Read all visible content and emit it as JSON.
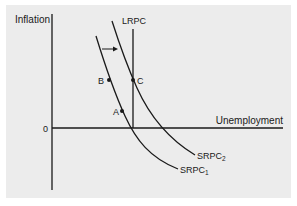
{
  "diagram": {
    "type": "phillips-curve",
    "y_axis_label": "Inflation",
    "x_axis_label": "Unemployment",
    "origin_label": "0",
    "curves": [
      {
        "id": "lrpc",
        "label": "LRPC",
        "kind": "vertical"
      },
      {
        "id": "srpc1",
        "label": "SRPC",
        "subscript": "1"
      },
      {
        "id": "srpc2",
        "label": "SRPC",
        "subscript": "2"
      }
    ],
    "points": [
      {
        "label": "A",
        "on": "SRPC1"
      },
      {
        "label": "B",
        "on": "SRPC1"
      },
      {
        "label": "C",
        "on": "SRPC2 / LRPC"
      }
    ],
    "shift_arrow": "SRPC1 → SRPC2 (rightward shift)",
    "colors": {
      "background": "#ececec",
      "line": "#1a1a1a"
    }
  }
}
